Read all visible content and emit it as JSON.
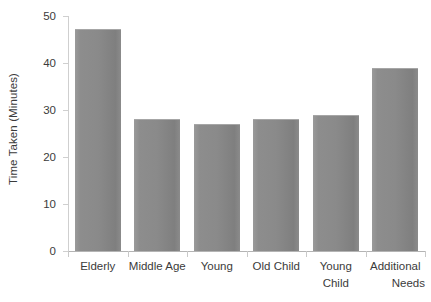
{
  "chart_data": {
    "type": "bar",
    "title": "",
    "xlabel": "",
    "ylabel": "Time Taken (Minutes)",
    "categories": [
      "Elderly",
      "Middle Age",
      "Young",
      "Old Child",
      "Young Child",
      "Additional Needs"
    ],
    "values": [
      47.0,
      27.8,
      26.9,
      27.8,
      28.8,
      38.7
    ],
    "ylim": [
      0,
      50
    ],
    "yticks": [
      0,
      10,
      20,
      30,
      40,
      50
    ],
    "ytick_labels": [
      "0",
      "10",
      "20",
      "30",
      "40",
      "50"
    ],
    "grid": false,
    "legend": null,
    "bar_color": "#8a8a8a",
    "axis_color": "#c9c9c9",
    "text_color": "#3b3b3b"
  },
  "axes": {
    "y_title": "Time Taken (Minutes)",
    "y_tick_labels": [
      "50",
      "40",
      "30",
      "20",
      "10",
      "0"
    ],
    "x_tick_labels": [
      {
        "line1": "Elderly",
        "line2": ""
      },
      {
        "line1": "Middle Age",
        "line2": ""
      },
      {
        "line1": "Young",
        "line2": ""
      },
      {
        "line1": "Old Child",
        "line2": ""
      },
      {
        "line1": "Young Child",
        "line2": ""
      },
      {
        "line1": "Additional",
        "line2": "Needs"
      }
    ]
  }
}
